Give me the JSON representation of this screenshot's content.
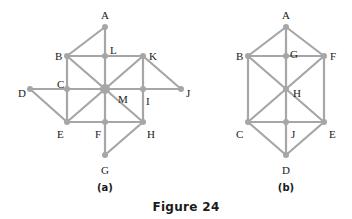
{
  "caption": "Figure 24",
  "figures": [
    {
      "id": "a",
      "label": "(a)",
      "nodes": [
        {
          "name": "A",
          "x": 105,
          "y": 27,
          "lx": 101,
          "ly": 15
        },
        {
          "name": "B",
          "x": 67,
          "y": 56,
          "lx": 55,
          "ly": 56
        },
        {
          "name": "L",
          "x": 105,
          "y": 56,
          "lx": 110,
          "ly": 50
        },
        {
          "name": "K",
          "x": 143,
          "y": 56,
          "lx": 149,
          "ly": 56
        },
        {
          "name": "D",
          "x": 30,
          "y": 89,
          "lx": 18,
          "ly": 93
        },
        {
          "name": "C",
          "x": 67,
          "y": 89,
          "lx": 57,
          "ly": 84
        },
        {
          "name": "M",
          "x": 105,
          "y": 89,
          "lx": 118,
          "ly": 99,
          "big": true
        },
        {
          "name": "I",
          "x": 143,
          "y": 89,
          "lx": 146,
          "ly": 101
        },
        {
          "name": "J",
          "x": 181,
          "y": 89,
          "lx": 186,
          "ly": 93
        },
        {
          "name": "E",
          "x": 67,
          "y": 122,
          "lx": 57,
          "ly": 134
        },
        {
          "name": "F",
          "x": 105,
          "y": 122,
          "lx": 95,
          "ly": 134
        },
        {
          "name": "H",
          "x": 143,
          "y": 122,
          "lx": 147,
          "ly": 134
        },
        {
          "name": "G",
          "x": 105,
          "y": 155,
          "lx": 101,
          "ly": 170
        }
      ],
      "edges": [
        [
          "A",
          "B"
        ],
        [
          "A",
          "L"
        ],
        [
          "L",
          "M"
        ],
        [
          "M",
          "F"
        ],
        [
          "F",
          "G"
        ],
        [
          "B",
          "L"
        ],
        [
          "L",
          "K"
        ],
        [
          "B",
          "C"
        ],
        [
          "C",
          "E"
        ],
        [
          "K",
          "I"
        ],
        [
          "I",
          "H"
        ],
        [
          "D",
          "C"
        ],
        [
          "C",
          "M"
        ],
        [
          "M",
          "I"
        ],
        [
          "I",
          "J"
        ],
        [
          "E",
          "F"
        ],
        [
          "F",
          "H"
        ],
        [
          "B",
          "M"
        ],
        [
          "M",
          "H"
        ],
        [
          "K",
          "M"
        ],
        [
          "M",
          "E"
        ],
        [
          "K",
          "J"
        ],
        [
          "D",
          "E"
        ],
        [
          "H",
          "G"
        ]
      ],
      "label_pos": {
        "x": 105,
        "y": 191
      }
    },
    {
      "id": "b",
      "label": "(b)",
      "nodes": [
        {
          "name": "A",
          "x": 286,
          "y": 27,
          "lx": 282,
          "ly": 15
        },
        {
          "name": "B",
          "x": 248,
          "y": 56,
          "lx": 236,
          "ly": 56
        },
        {
          "name": "G",
          "x": 286,
          "y": 56,
          "lx": 290,
          "ly": 54
        },
        {
          "name": "F",
          "x": 324,
          "y": 56,
          "lx": 330,
          "ly": 56
        },
        {
          "name": "H",
          "x": 286,
          "y": 89,
          "lx": 293,
          "ly": 93
        },
        {
          "name": "C",
          "x": 248,
          "y": 122,
          "lx": 236,
          "ly": 134
        },
        {
          "name": "J",
          "x": 286,
          "y": 122,
          "lx": 291,
          "ly": 134
        },
        {
          "name": "E",
          "x": 324,
          "y": 122,
          "lx": 329,
          "ly": 134
        },
        {
          "name": "D",
          "x": 286,
          "y": 155,
          "lx": 282,
          "ly": 170
        }
      ],
      "edges": [
        [
          "A",
          "B"
        ],
        [
          "A",
          "F"
        ],
        [
          "A",
          "G"
        ],
        [
          "G",
          "H"
        ],
        [
          "H",
          "J"
        ],
        [
          "J",
          "D"
        ],
        [
          "B",
          "G"
        ],
        [
          "G",
          "F"
        ],
        [
          "B",
          "C"
        ],
        [
          "F",
          "E"
        ],
        [
          "B",
          "H"
        ],
        [
          "H",
          "E"
        ],
        [
          "F",
          "H"
        ],
        [
          "H",
          "C"
        ],
        [
          "C",
          "J"
        ],
        [
          "J",
          "E"
        ],
        [
          "C",
          "D"
        ],
        [
          "E",
          "D"
        ]
      ],
      "label_pos": {
        "x": 286,
        "y": 191
      }
    }
  ],
  "caption_pos": {
    "x": 186,
    "y": 211
  },
  "colors": {
    "edge": "#a6a6a6",
    "node": "#a6a6a6",
    "text": "#1a1a1a"
  }
}
